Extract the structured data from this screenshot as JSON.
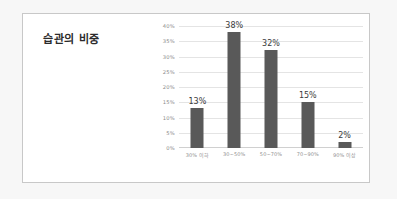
{
  "chart_data": {
    "type": "bar",
    "title": "습관의 비중",
    "categories": [
      "30% 이하",
      "30~50%",
      "50~70%",
      "70~90%",
      "90% 이상"
    ],
    "values": [
      13,
      38,
      32,
      15,
      2
    ],
    "value_labels": [
      "13%",
      "38%",
      "32%",
      "15%",
      "2%"
    ],
    "xlabel": "",
    "ylabel": "",
    "ylim": [
      0,
      40
    ],
    "ytick_labels": [
      "0%",
      "5%",
      "10%",
      "15%",
      "20%",
      "25%",
      "30%",
      "35%",
      "40%"
    ],
    "ytick_values": [
      0,
      5,
      10,
      15,
      20,
      25,
      30,
      35,
      40
    ],
    "grid": true,
    "legend": "none",
    "series_color": "#595959",
    "gridline_color": "#e4e4e4",
    "frame_color": "#c8c8c8",
    "page_background": "#f7f7f7",
    "plot_background": "#ffffff"
  }
}
